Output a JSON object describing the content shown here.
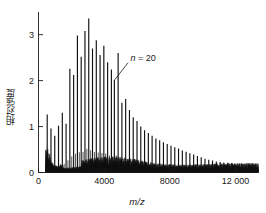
{
  "figure": {
    "ylabel": "相対強度",
    "xlabel": "m/z",
    "annotation": {
      "symbol": "n",
      "relation": " = ",
      "value": "20",
      "full": "n = 20"
    },
    "colors": {
      "axis": "#1a1a1a",
      "trace": "#101010",
      "text": "#1a1a1a",
      "background": "#ffffff"
    }
  },
  "chart_data": {
    "type": "line",
    "title": "",
    "subtitle": "",
    "xlabel": "m/z",
    "ylabel": "相対強度",
    "xlim": [
      0,
      13400
    ],
    "ylim": [
      0,
      3.45
    ],
    "grid": false,
    "legend": null,
    "xticks": [
      0,
      4000,
      8000,
      12000
    ],
    "xticklabels": [
      "0",
      "4000",
      "8000",
      "12 000"
    ],
    "yticks": [
      0,
      1,
      2,
      3
    ],
    "yticklabels": [
      "0",
      "1",
      "2",
      "3"
    ],
    "annotations": [
      {
        "text": "n = 20",
        "x": 5600,
        "y": 2.42,
        "points_to_x": 4620,
        "points_to_y": 2.02
      }
    ],
    "series": [
      {
        "name": "MALDI-TOF polymer distribution",
        "repeat_unit_mz": 230,
        "baseline_level": 0.12,
        "peaks": [
          {
            "mz": 530,
            "intensity": 1.26
          },
          {
            "mz": 760,
            "intensity": 0.96
          },
          {
            "mz": 990,
            "intensity": 0.8
          },
          {
            "mz": 1220,
            "intensity": 1.02
          },
          {
            "mz": 1450,
            "intensity": 1.3
          },
          {
            "mz": 1680,
            "intensity": 1.06
          },
          {
            "mz": 1910,
            "intensity": 2.26
          },
          {
            "mz": 2140,
            "intensity": 2.12
          },
          {
            "mz": 2370,
            "intensity": 2.98
          },
          {
            "mz": 2600,
            "intensity": 2.52
          },
          {
            "mz": 2830,
            "intensity": 3.08
          },
          {
            "mz": 3060,
            "intensity": 3.35
          },
          {
            "mz": 3290,
            "intensity": 2.7
          },
          {
            "mz": 3520,
            "intensity": 2.88
          },
          {
            "mz": 3750,
            "intensity": 2.56
          },
          {
            "mz": 3980,
            "intensity": 2.76
          },
          {
            "mz": 4210,
            "intensity": 2.4
          },
          {
            "mz": 4440,
            "intensity": 2.24
          },
          {
            "mz": 4620,
            "intensity": 2.02
          },
          {
            "mz": 4850,
            "intensity": 2.6
          },
          {
            "mz": 5080,
            "intensity": 1.52
          },
          {
            "mz": 5310,
            "intensity": 1.6
          },
          {
            "mz": 5540,
            "intensity": 1.36
          },
          {
            "mz": 5770,
            "intensity": 1.2
          },
          {
            "mz": 6000,
            "intensity": 1.12
          },
          {
            "mz": 6230,
            "intensity": 1.0
          },
          {
            "mz": 6460,
            "intensity": 0.92
          },
          {
            "mz": 6690,
            "intensity": 0.86
          },
          {
            "mz": 6920,
            "intensity": 0.8
          },
          {
            "mz": 7150,
            "intensity": 0.74
          },
          {
            "mz": 7380,
            "intensity": 0.7
          },
          {
            "mz": 7610,
            "intensity": 0.66
          },
          {
            "mz": 7840,
            "intensity": 0.62
          },
          {
            "mz": 8070,
            "intensity": 0.58
          },
          {
            "mz": 8300,
            "intensity": 0.55
          },
          {
            "mz": 8530,
            "intensity": 0.52
          },
          {
            "mz": 8760,
            "intensity": 0.48
          },
          {
            "mz": 8990,
            "intensity": 0.45
          },
          {
            "mz": 9220,
            "intensity": 0.42
          },
          {
            "mz": 9450,
            "intensity": 0.39
          },
          {
            "mz": 9680,
            "intensity": 0.36
          },
          {
            "mz": 9910,
            "intensity": 0.33
          },
          {
            "mz": 10140,
            "intensity": 0.3
          },
          {
            "mz": 10370,
            "intensity": 0.28
          },
          {
            "mz": 10600,
            "intensity": 0.26
          },
          {
            "mz": 10830,
            "intensity": 0.24
          },
          {
            "mz": 11060,
            "intensity": 0.23
          },
          {
            "mz": 11290,
            "intensity": 0.22
          },
          {
            "mz": 11520,
            "intensity": 0.21
          },
          {
            "mz": 11750,
            "intensity": 0.2
          },
          {
            "mz": 11980,
            "intensity": 0.19
          },
          {
            "mz": 12210,
            "intensity": 0.18
          },
          {
            "mz": 12440,
            "intensity": 0.175
          },
          {
            "mz": 12670,
            "intensity": 0.17
          },
          {
            "mz": 12900,
            "intensity": 0.165
          },
          {
            "mz": 13130,
            "intensity": 0.16
          }
        ]
      }
    ]
  }
}
